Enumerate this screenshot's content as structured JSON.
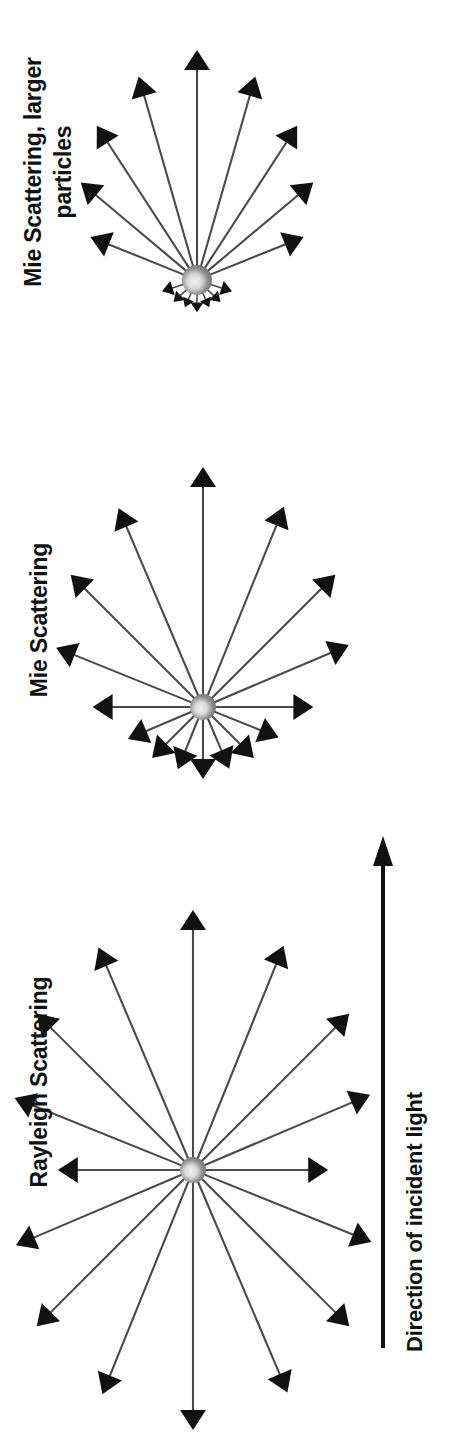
{
  "figure": {
    "title_text_orientation": "rotated-90-ccw",
    "background": "#ffffff",
    "line_color": "#4a4a4a",
    "arrowhead_color": "#111111",
    "particle_color_outer": "#8c8c8c",
    "particle_color_inner": "#f2f2f2",
    "text_color": "#111111"
  },
  "labels": {
    "mie_large": "Mie Scattering, larger\nparticles",
    "mie": "Mie Scattering",
    "rayleigh": "Rayleigh Scattering",
    "incident": "Direction of incident light"
  },
  "chart_data": {
    "type": "scatter",
    "xlabel": "",
    "ylabel": "",
    "annotations": [
      "Mie Scattering, larger particles",
      "Mie Scattering",
      "Rayleigh Scattering",
      "Direction of incident light"
    ],
    "incident_direction_deg": 0,
    "panels": [
      {
        "name": "Rayleigh Scattering",
        "center_px": [
          193,
          1170
        ],
        "description": "Near-symmetric dipole-like pattern: forward and backward lobes almost equal, slight minimum at 90 degrees.",
        "rays": [
          {
            "angle_deg": 0,
            "length": 1.0
          },
          {
            "angle_deg": 22,
            "length": 0.93
          },
          {
            "angle_deg": 45,
            "length": 0.85
          },
          {
            "angle_deg": 67,
            "length": 0.74
          },
          {
            "angle_deg": 90,
            "length": 0.52
          },
          {
            "angle_deg": 112,
            "length": 0.74
          },
          {
            "angle_deg": 135,
            "length": 0.85
          },
          {
            "angle_deg": 157,
            "length": 0.93
          },
          {
            "angle_deg": 180,
            "length": 1.0
          },
          {
            "angle_deg": 202,
            "length": 0.93
          },
          {
            "angle_deg": 225,
            "length": 0.85
          },
          {
            "angle_deg": 247,
            "length": 0.74
          },
          {
            "angle_deg": 270,
            "length": 0.52
          },
          {
            "angle_deg": 292,
            "length": 0.74
          },
          {
            "angle_deg": 315,
            "length": 0.85
          },
          {
            "angle_deg": 337,
            "length": 0.93
          }
        ]
      },
      {
        "name": "Mie Scattering",
        "center_px": [
          203,
          707
        ],
        "description": "Forward-biased pattern: long forward rays, markedly shorter backward rays.",
        "rays": [
          {
            "angle_deg": 0,
            "length": 1.0
          },
          {
            "angle_deg": 22,
            "length": 0.9
          },
          {
            "angle_deg": 45,
            "length": 0.78
          },
          {
            "angle_deg": 67,
            "length": 0.66
          },
          {
            "angle_deg": 90,
            "length": 0.46
          },
          {
            "angle_deg": 112,
            "length": 0.34
          },
          {
            "angle_deg": 135,
            "length": 0.3
          },
          {
            "angle_deg": 157,
            "length": 0.28
          },
          {
            "angle_deg": 180,
            "length": 0.3
          },
          {
            "angle_deg": 202,
            "length": 0.28
          },
          {
            "angle_deg": 225,
            "length": 0.3
          },
          {
            "angle_deg": 247,
            "length": 0.34
          },
          {
            "angle_deg": 270,
            "length": 0.46
          },
          {
            "angle_deg": 292,
            "length": 0.66
          },
          {
            "angle_deg": 315,
            "length": 0.78
          },
          {
            "angle_deg": 337,
            "length": 0.9
          }
        ]
      },
      {
        "name": "Mie Scattering, larger particles",
        "center_px": [
          197,
          280
        ],
        "description": "Strongly forward-peaked pattern: very long narrow forward lobe, tiny backward rays.",
        "rays": [
          {
            "angle_deg": 0,
            "length": 1.0
          },
          {
            "angle_deg": 16,
            "length": 0.92
          },
          {
            "angle_deg": 33,
            "length": 0.8
          },
          {
            "angle_deg": 50,
            "length": 0.66
          },
          {
            "angle_deg": 68,
            "length": 0.5
          },
          {
            "angle_deg": 108,
            "length": 0.16
          },
          {
            "angle_deg": 133,
            "length": 0.14
          },
          {
            "angle_deg": 156,
            "length": 0.13
          },
          {
            "angle_deg": 180,
            "length": 0.14
          },
          {
            "angle_deg": 204,
            "length": 0.13
          },
          {
            "angle_deg": 227,
            "length": 0.14
          },
          {
            "angle_deg": 252,
            "length": 0.16
          },
          {
            "angle_deg": 292,
            "length": 0.5
          },
          {
            "angle_deg": 310,
            "length": 0.66
          },
          {
            "angle_deg": 327,
            "length": 0.8
          },
          {
            "angle_deg": 344,
            "length": 0.92
          }
        ]
      }
    ]
  }
}
